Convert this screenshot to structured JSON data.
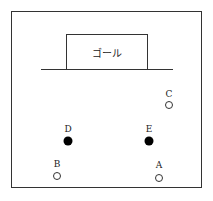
{
  "goal": {
    "label": "ゴール"
  },
  "players": [
    {
      "id": "A",
      "label": "A",
      "type": "open",
      "x": 159,
      "y": 178,
      "lx": 159,
      "ly": 161
    },
    {
      "id": "B",
      "label": "B",
      "type": "open",
      "x": 57,
      "y": 176,
      "lx": 57,
      "ly": 160
    },
    {
      "id": "C",
      "label": "C",
      "type": "open",
      "x": 169,
      "y": 105,
      "lx": 169,
      "ly": 90
    },
    {
      "id": "D",
      "label": "D",
      "type": "filled",
      "x": 68,
      "y": 141,
      "lx": 68,
      "ly": 125
    },
    {
      "id": "E",
      "label": "E",
      "type": "filled",
      "x": 149,
      "y": 141,
      "lx": 149,
      "ly": 125
    }
  ]
}
